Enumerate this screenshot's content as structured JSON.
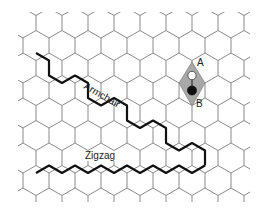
{
  "figure": {
    "type": "honeycomb-lattice",
    "background": "#ffffff",
    "lattice": {
      "orientation": "pointy-top",
      "hex_half_width": 13,
      "hex_radius": 15,
      "row_spacing": 22.5,
      "origin_center": [
        49,
        23
      ],
      "rows": 9,
      "cols": 10,
      "line_color": "#8a8a8a",
      "line_width": 1
    },
    "paths": {
      "armchair": {
        "label": "Armchair",
        "color": "#111111",
        "width": 2.2,
        "points": [
          [
            36,
            53
          ],
          [
            49,
            60.5
          ],
          [
            49,
            75.5
          ],
          [
            62,
            83
          ],
          [
            75,
            75.5
          ],
          [
            88,
            83
          ],
          [
            88,
            98
          ],
          [
            101,
            105.5
          ],
          [
            114,
            98
          ],
          [
            127,
            105.5
          ],
          [
            127,
            120.5
          ],
          [
            140,
            128
          ],
          [
            153,
            120.5
          ],
          [
            166,
            128
          ],
          [
            166,
            143
          ],
          [
            179,
            150.5
          ],
          [
            192,
            143
          ],
          [
            205,
            150.5
          ],
          [
            205,
            165.5
          ]
        ],
        "label_pos": [
          87,
          81
        ],
        "label_rotation": 30
      },
      "zigzag": {
        "label": "Zigzag",
        "color": "#111111",
        "width": 2.2,
        "points": [
          [
            36,
            173
          ],
          [
            49,
            165.5
          ],
          [
            62,
            173
          ],
          [
            75,
            165.5
          ],
          [
            88,
            173
          ],
          [
            101,
            165.5
          ],
          [
            114,
            173
          ],
          [
            127,
            165.5
          ],
          [
            140,
            173
          ],
          [
            153,
            165.5
          ],
          [
            166,
            173
          ],
          [
            179,
            165.5
          ],
          [
            192,
            173
          ],
          [
            205,
            165.5
          ]
        ],
        "label_pos": [
          84,
          151
        ]
      }
    },
    "unit_cell": {
      "fill": "#a8a8a8",
      "stroke": "#888888",
      "points": [
        [
          192,
          62
        ],
        [
          205,
          83
        ],
        [
          192,
          106
        ],
        [
          179,
          83
        ]
      ]
    },
    "atoms": [
      {
        "label": "A",
        "x": 192,
        "y": 75.5,
        "fill": "#ffffff",
        "stroke": "#333333",
        "r": 4.2,
        "label_pos": [
          197,
          58
        ]
      },
      {
        "label": "B",
        "x": 192,
        "y": 90.5,
        "fill": "#111111",
        "stroke": "#111111",
        "r": 4.5,
        "label_pos": [
          196,
          99
        ]
      }
    ]
  }
}
